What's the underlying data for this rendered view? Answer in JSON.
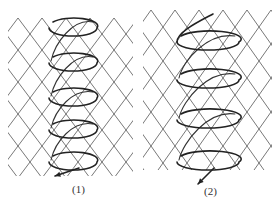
{
  "figure": {
    "panels": [
      {
        "id": "panel-1",
        "label": "(1)",
        "label_pos": {
          "x": 72,
          "y": 183
        },
        "mesh": {
          "x0": 8,
          "x1": 133,
          "y0": 18,
          "y1": 176,
          "cell_w": 24,
          "cell_h": 32
        },
        "helix": {
          "cx": 73,
          "rx": 24,
          "ry": 8,
          "loops_y": [
            28,
            63,
            98,
            130,
            162
          ],
          "exit_arrow": {
            "x": 55,
            "y": 176
          }
        }
      },
      {
        "id": "panel-2",
        "label": "(2)",
        "label_pos": {
          "x": 204,
          "y": 185
        },
        "mesh": {
          "x0": 143,
          "x1": 272,
          "y0": 10,
          "y1": 170,
          "cell_w": 24,
          "cell_h": 34
        },
        "helix": {
          "cx": 208,
          "rx": 31,
          "ry": 8,
          "loops_y": [
            42,
            80,
            120,
            162
          ],
          "start_tail": {
            "x": 213,
            "y": 14
          },
          "exit_arrow": {
            "x": 198,
            "y": 184
          }
        }
      }
    ],
    "colors": {
      "line": "#222222",
      "mesh": "#555555",
      "background": "#ffffff"
    }
  }
}
